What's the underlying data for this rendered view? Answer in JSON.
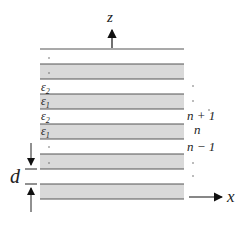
{
  "diagram": {
    "axes": {
      "z_label": "z",
      "x_label": "x"
    },
    "layers": {
      "eps2_label_top": "ε",
      "eps2_sub_top": "2",
      "eps1_label_top": "ε",
      "eps1_sub_top": "1",
      "eps2_label_mid": "ε",
      "eps2_sub_mid": "2",
      "eps1_label_mid": "ε",
      "eps1_sub_mid": "1"
    },
    "indices": {
      "n_plus_1": "n + 1",
      "n": "n",
      "n_minus_1": "n − 1"
    },
    "period_label": "d",
    "ellipsis": "·",
    "colors": {
      "band_fill": "#d9d9d9",
      "line": "#555555",
      "arrow": "#111111"
    }
  }
}
